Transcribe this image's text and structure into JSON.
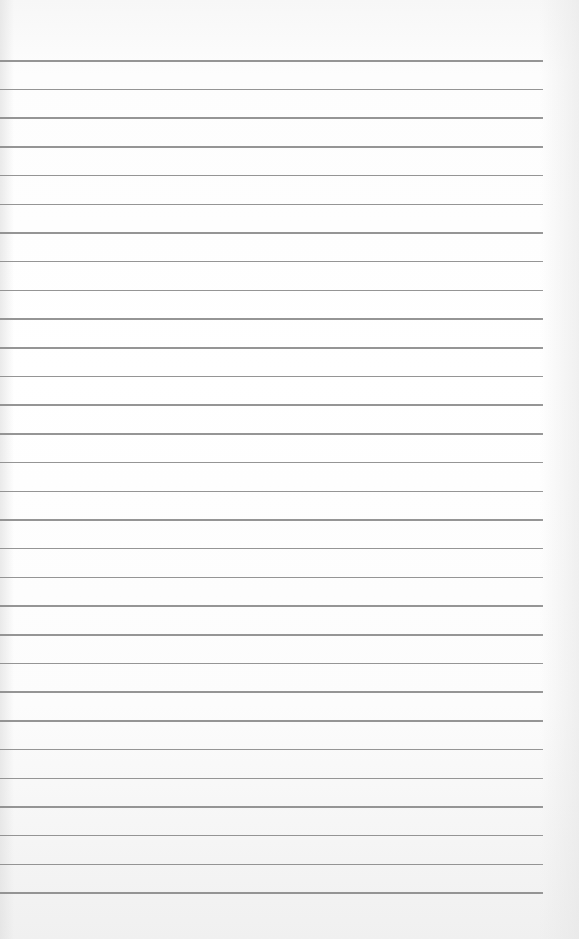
{
  "page": {
    "type": "lined-paper",
    "background_color": "#ffffff",
    "rule_color": "#8a8a8a",
    "rule_count": 30,
    "first_rule_y": 60,
    "rule_spacing": 28.7,
    "rule_left": 0,
    "rule_right": 543,
    "text_content": []
  }
}
